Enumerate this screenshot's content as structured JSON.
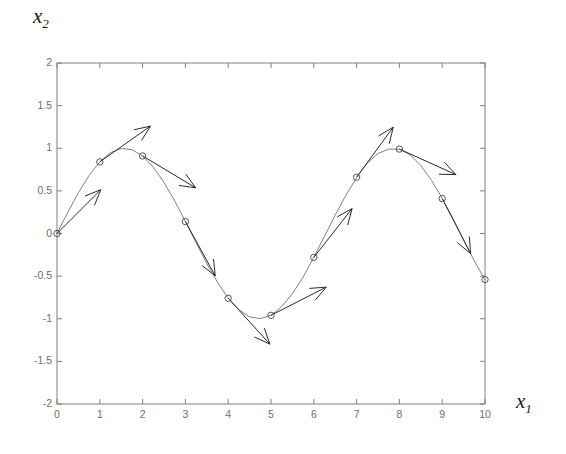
{
  "figure": {
    "ylabel_text": "x",
    "ylabel_sub": "2",
    "xlabel_text": "x",
    "xlabel_sub": "1",
    "background": "#ffffff",
    "axis_color": "#808080",
    "curve_color": "#808080",
    "arrow_color": "#2b2b2b",
    "marker_color": "#555555",
    "tick_label_color": "#6e6e6e"
  },
  "chart_data": {
    "type": "line",
    "title": "",
    "xlabel": "x_1",
    "ylabel": "x_2",
    "xlim": [
      0,
      10
    ],
    "ylim": [
      -2,
      2
    ],
    "grid": false,
    "legend": null,
    "xticks": [
      0,
      1,
      2,
      3,
      4,
      5,
      6,
      7,
      8,
      9,
      10
    ],
    "xticklabels": [
      "0",
      "1",
      "2",
      "3",
      "4",
      "5",
      "6",
      "7",
      "8",
      "9",
      "10"
    ],
    "yticks": [
      -2,
      -1.5,
      -1,
      -0.5,
      0,
      0.5,
      1,
      1.5,
      2
    ],
    "yticklabels": [
      "-2",
      "-1.5",
      "-1",
      "-0.5",
      "0",
      "0.5",
      "1",
      "1.5",
      "2"
    ],
    "tick_direction": "in",
    "series": [
      {
        "name": "sin(x)",
        "function": "sin",
        "marker": "o",
        "marker_x": [
          0,
          1,
          2,
          3,
          4,
          5,
          6,
          7,
          8,
          9,
          10
        ],
        "marker_y": [
          0.0,
          0.84,
          0.91,
          0.14,
          -0.76,
          -0.96,
          -0.28,
          0.66,
          0.99,
          0.41,
          -0.54
        ],
        "x_samples": [
          0,
          0.25,
          0.5,
          0.75,
          1,
          1.25,
          1.5,
          1.75,
          2,
          2.25,
          2.5,
          2.75,
          3,
          3.25,
          3.5,
          3.75,
          4,
          4.25,
          4.5,
          4.75,
          5,
          5.25,
          5.5,
          5.75,
          6,
          6.25,
          6.5,
          6.75,
          7,
          7.25,
          7.5,
          7.75,
          8,
          8.25,
          8.5,
          8.75,
          9,
          9.25,
          9.5,
          9.75,
          10
        ],
        "y_samples": [
          0.0,
          0.247,
          0.479,
          0.682,
          0.841,
          0.949,
          0.997,
          0.984,
          0.909,
          0.778,
          0.599,
          0.382,
          0.141,
          -0.108,
          -0.351,
          -0.572,
          -0.757,
          -0.895,
          -0.978,
          -0.999,
          -0.959,
          -0.859,
          -0.706,
          -0.512,
          -0.279,
          -0.033,
          0.215,
          0.449,
          0.657,
          0.828,
          0.938,
          0.991,
          0.989,
          0.924,
          0.798,
          0.623,
          0.412,
          0.178,
          -0.075,
          -0.321,
          -0.544
        ]
      }
    ],
    "arrows": [
      {
        "name": "arrow-at-x0",
        "x": 0.0,
        "y": 0.0,
        "dx": 0.62,
        "dy": 0.62
      },
      {
        "name": "arrow-at-x1",
        "x": 1.0,
        "y": 0.84,
        "dx": 0.85,
        "dy": 0.6
      },
      {
        "name": "arrow-at-x2",
        "x": 2.0,
        "y": 0.91,
        "dx": 0.85,
        "dy": -0.51
      },
      {
        "name": "arrow-at-x3",
        "x": 3.0,
        "y": 0.14,
        "dx": 0.5,
        "dy": -0.91
      },
      {
        "name": "arrow-at-x4",
        "x": 4.0,
        "y": -0.76,
        "dx": 0.6,
        "dy": -0.66
      },
      {
        "name": "arrow-at-x5",
        "x": 5.0,
        "y": -0.96,
        "dx": 0.96,
        "dy": 0.49
      },
      {
        "name": "arrow-at-x6",
        "x": 6.0,
        "y": -0.28,
        "dx": 0.66,
        "dy": 0.84
      },
      {
        "name": "arrow-at-x7",
        "x": 7.0,
        "y": 0.66,
        "dx": 0.6,
        "dy": 0.82
      },
      {
        "name": "arrow-at-x8",
        "x": 8.0,
        "y": 0.99,
        "dx": 0.93,
        "dy": -0.42
      },
      {
        "name": "arrow-at-x9",
        "x": 9.0,
        "y": 0.41,
        "dx": 0.48,
        "dy": -0.93
      }
    ]
  }
}
